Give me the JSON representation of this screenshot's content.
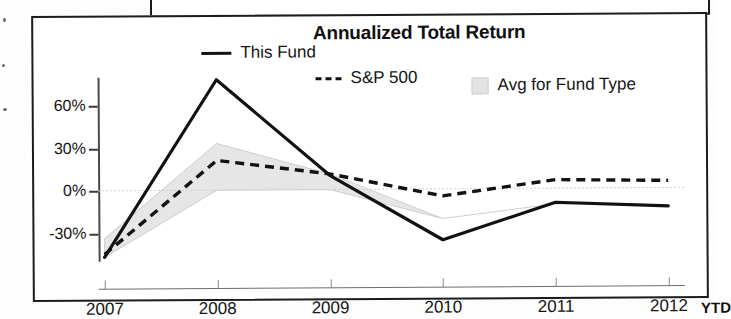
{
  "chart_data": {
    "type": "line",
    "title": "Annualized Total Return",
    "xlabel": "",
    "ylabel": "",
    "x": [
      "2007",
      "2008",
      "2009",
      "2010",
      "2011",
      "2012"
    ],
    "x_suffix": "YTD",
    "ylim": [
      -50,
      80
    ],
    "yticks": [
      60,
      30,
      0,
      -30
    ],
    "ytick_labels": [
      "60%",
      "30%",
      "0%",
      "-30%"
    ],
    "grid": false,
    "legend_position": "top",
    "series": [
      {
        "name": "This Fund",
        "style": "solid",
        "color": "#121212",
        "values": [
          -47,
          78,
          10,
          -36,
          -10,
          -13
        ]
      },
      {
        "name": "S&P 500",
        "style": "dashed",
        "color": "#121212",
        "values": [
          -45,
          21,
          11,
          -5,
          6,
          5
        ]
      },
      {
        "name": "Avg for Fund Type",
        "style": "band",
        "color": "#e3e3e3",
        "upper": [
          -34,
          33,
          11,
          -21,
          -11,
          -12
        ],
        "lower": [
          -47,
          0,
          0,
          -21,
          -11,
          -12
        ]
      }
    ]
  },
  "chart": {
    "title": "Annualized Total Return",
    "legend": [
      {
        "label": "This Fund",
        "marker": "solid-line"
      },
      {
        "label": "S&P 500",
        "marker": "dashed-line"
      },
      {
        "label": "Avg for Fund Type",
        "marker": "shaded-box"
      }
    ],
    "ytd_note": "YTD"
  }
}
